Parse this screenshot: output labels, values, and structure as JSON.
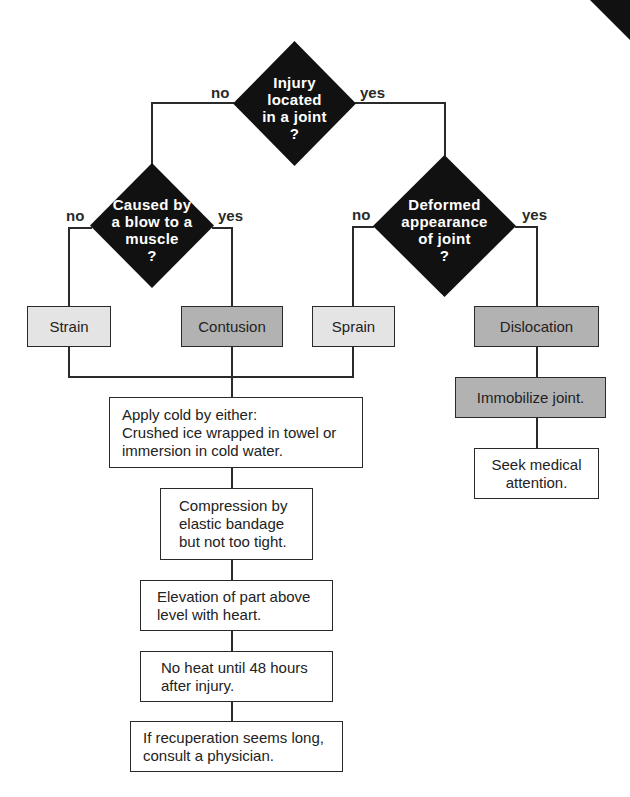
{
  "colors": {
    "decision_fill": "#111111",
    "line": "#2a2a2a",
    "box_light": "#e4e4e4",
    "box_dark": "#b2b2b2",
    "box_white": "#ffffff"
  },
  "decisions": {
    "injury_in_joint": {
      "lines": [
        "Injury",
        "located",
        "in a joint",
        "?"
      ],
      "no_label": "no",
      "yes_label": "yes"
    },
    "caused_by_blow": {
      "lines": [
        "Caused by",
        "a blow to a",
        "muscle",
        "?"
      ],
      "no_label": "no",
      "yes_label": "yes"
    },
    "deformed_joint": {
      "lines": [
        "Deformed",
        "appearance",
        "of  joint",
        "?"
      ],
      "no_label": "no",
      "yes_label": "yes"
    }
  },
  "outcomes": {
    "strain": "Strain",
    "contusion": "Contusion",
    "sprain": "Sprain",
    "dislocation": "Dislocation"
  },
  "steps": {
    "apply_cold": "Apply cold by either:\nCrushed ice wrapped in towel or\nimmersion in cold water.",
    "compression": "Compression by\nelastic bandage\nbut not too tight.",
    "elevation": "Elevation of part above\nlevel with heart.",
    "no_heat": "No heat until 48 hours\nafter  injury.",
    "consult": "If recuperation seems long,\nconsult a physician.",
    "immobilize": "Immobilize  joint.",
    "seek_medical": "Seek medical\nattention."
  }
}
